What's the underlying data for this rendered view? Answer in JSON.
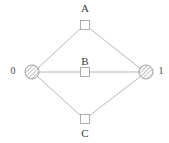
{
  "diagram": {
    "type": "graph",
    "title": "",
    "background_color": "#ffffff",
    "edge_color": "#9a9a9a",
    "node_stroke_color": "#9a9a9a",
    "node_fill_color": "#ffffff",
    "hatch_color": "#8a8a8a",
    "label_color": "#3a3a3a",
    "terminals": [
      {
        "id": "terminal-0",
        "label": "0",
        "shape": "hatched-circle",
        "x": 32,
        "y": 72,
        "radius": 7,
        "label_x": 12,
        "label_y": 72
      },
      {
        "id": "terminal-1",
        "label": "1",
        "shape": "hatched-circle",
        "x": 146,
        "y": 72,
        "radius": 7,
        "label_x": 160,
        "label_y": 72
      }
    ],
    "nodes": [
      {
        "id": "node-a",
        "label": "A",
        "shape": "square",
        "x": 85,
        "y": 25,
        "size": 9,
        "label_x": 85,
        "label_y": 8
      },
      {
        "id": "node-b",
        "label": "B",
        "shape": "square",
        "x": 85,
        "y": 72,
        "size": 9,
        "label_x": 85,
        "label_y": 61
      },
      {
        "id": "node-c",
        "label": "C",
        "shape": "square",
        "x": 85,
        "y": 119,
        "size": 9,
        "label_x": 85,
        "label_y": 134
      }
    ],
    "edges": [
      {
        "id": "edge-0-a",
        "from": "terminal-0",
        "to": "node-a"
      },
      {
        "id": "edge-a-1",
        "from": "node-a",
        "to": "terminal-1"
      },
      {
        "id": "edge-0-b",
        "from": "terminal-0",
        "to": "node-b"
      },
      {
        "id": "edge-b-1",
        "from": "node-b",
        "to": "terminal-1"
      },
      {
        "id": "edge-0-c",
        "from": "terminal-0",
        "to": "node-c"
      },
      {
        "id": "edge-c-1",
        "from": "node-c",
        "to": "terminal-1"
      }
    ]
  }
}
